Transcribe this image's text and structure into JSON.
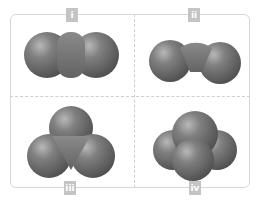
{
  "diagram": {
    "panels": [
      {
        "label": "i",
        "shape": "linear"
      },
      {
        "label": "ii",
        "shape": "bent"
      },
      {
        "label": "iii",
        "shape": "trigonal planar"
      },
      {
        "label": "iv",
        "shape": "tetrahedral"
      }
    ],
    "colors": {
      "sphere": "#7a7a7a",
      "sphere_highlight": "#b8b8b8",
      "sphere_shadow": "#4e4e4e",
      "label_bg": "#c4c4c4",
      "border": "#d8d8d8"
    }
  }
}
